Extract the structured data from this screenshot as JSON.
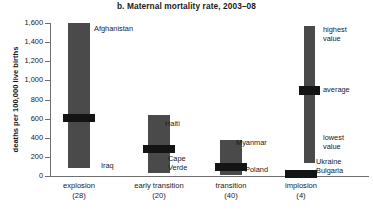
{
  "chart_data": {
    "type": "bar",
    "title": "b. Maternal mortality rate, 2003–08",
    "xlabel": "",
    "ylabel": "deaths per 100,000 live births",
    "ylim": [
      0,
      1600
    ],
    "ytick_labels": [
      "1,600",
      "1,400",
      "1,200",
      "1,000",
      "800",
      "600",
      "400",
      "200",
      "0"
    ],
    "ytick_values": [
      1600,
      1400,
      1200,
      1000,
      800,
      600,
      400,
      200,
      0
    ],
    "grid": false,
    "legend_position": "right",
    "categories": [
      "explosion",
      "early transition",
      "transition",
      "implosion"
    ],
    "category_counts": [
      "(28)",
      "(20)",
      "(40)",
      "(4)"
    ],
    "series": [
      {
        "name": "highest value",
        "values": [
          1600,
          640,
          380,
          40
        ]
      },
      {
        "name": "average",
        "values": [
          610,
          280,
          95,
          25
        ]
      },
      {
        "name": "lowest value",
        "values": [
          85,
          30,
          8,
          10
        ]
      }
    ],
    "annotations": [
      {
        "text": "Afghanistan",
        "role": "highest",
        "category": "explosion"
      },
      {
        "text": "Iraq",
        "role": "lowest",
        "category": "explosion"
      },
      {
        "text": "Haiti",
        "role": "highest",
        "category": "early transition"
      },
      {
        "text": "Cape",
        "role": "lowest-line1",
        "category": "early transition"
      },
      {
        "text": "Verde",
        "role": "lowest-line2",
        "category": "early transition"
      },
      {
        "text": "Myanmar",
        "role": "highest",
        "category": "transition"
      },
      {
        "text": "Poland",
        "role": "lowest",
        "category": "transition"
      },
      {
        "text": "Ukraine",
        "role": "highest",
        "category": "implosion"
      },
      {
        "text": "Bulgaria",
        "role": "lowest",
        "category": "implosion"
      }
    ],
    "legend": {
      "highest_label": "highest",
      "highest_label2": "value",
      "average_label": "average",
      "lowest_label": "lowest",
      "lowest_label2": "value"
    }
  }
}
